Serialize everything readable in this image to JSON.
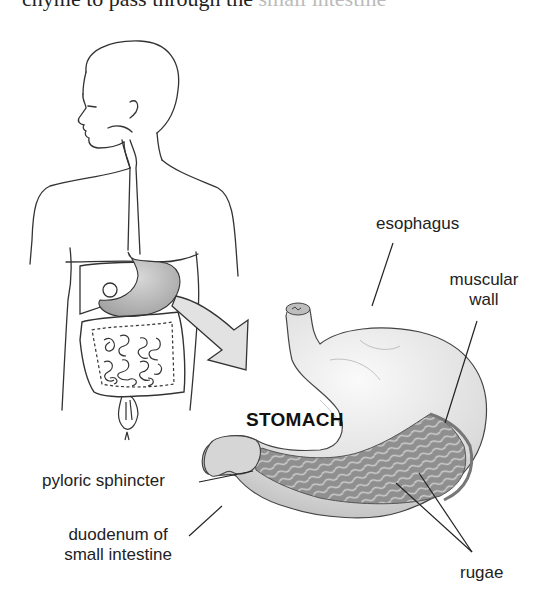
{
  "caption_fragment": {
    "visible": "chyme to pass through the",
    "faded": " small intestine"
  },
  "diagram": {
    "title": "STOMACH",
    "labels": {
      "esophagus": "esophagus",
      "muscular_wall_line1": "muscular",
      "muscular_wall_line2": "wall",
      "pyloric_sphincter": "pyloric sphincter",
      "duodenum_line1": "duodenum of",
      "duodenum_line2": "small intestine",
      "rugae": "rugae"
    },
    "figures": {
      "body_outline": "human-torso-digestive-system",
      "zoom_arrow": "arrow-to-stomach-detail",
      "stomach_detail": "stomach-cutaway"
    },
    "colors": {
      "line": "#333333",
      "organ_fill": "#c9c9c9",
      "stomach_fill": "#e6e6e6",
      "rugae_fill": "#9a9a9a",
      "arrow_fill": "#e2e2e2"
    }
  }
}
